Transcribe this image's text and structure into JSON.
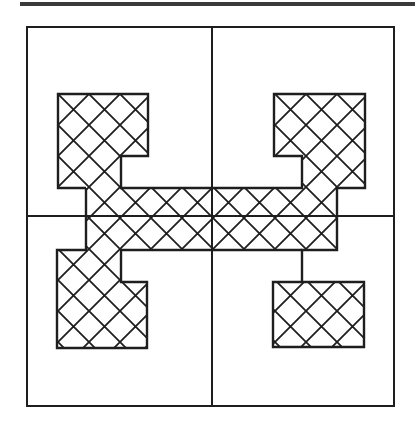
{
  "figure": {
    "colors": {
      "line": "#1e1e1e",
      "background": "#ffffff",
      "rule": "#3a3a3a"
    },
    "hatch_spacing": 31
  }
}
